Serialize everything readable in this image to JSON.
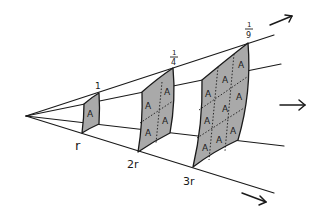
{
  "diagram": {
    "panels": [
      {
        "distance_label": "r",
        "intensity_label": "1",
        "area_labels": [
          "A"
        ]
      },
      {
        "distance_label": "2r",
        "intensity_label_num": "1",
        "intensity_label_den": "4",
        "area_labels": [
          "A",
          "A",
          "A",
          "A"
        ]
      },
      {
        "distance_label": "3r",
        "intensity_label_num": "1",
        "intensity_label_den": "9",
        "area_labels": [
          "A",
          "A",
          "A",
          "A",
          "A",
          "A",
          "A",
          "A",
          "A"
        ]
      }
    ],
    "arrows": [
      "top-right-arrow",
      "middle-right-arrow",
      "bottom-right-arrow"
    ],
    "colors": {
      "panel_fill": "#a9a9a9",
      "line": "#1a1a1a",
      "background": "#ffffff"
    }
  }
}
